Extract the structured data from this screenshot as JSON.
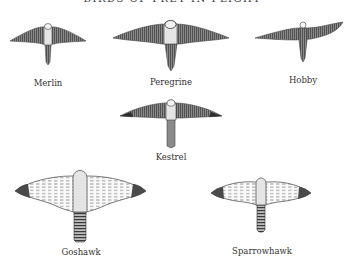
{
  "title": "BIRDS OF PREY IN FLIGHT",
  "colors": {
    "ink": "#555555",
    "dark_ink": "#3a3a3a",
    "background": "#ffffff"
  },
  "birds": [
    {
      "name": "Merlin",
      "group": "falcon",
      "label_x": 48,
      "label_y": 79
    },
    {
      "name": "Peregrine",
      "group": "falcon",
      "label_x": 171,
      "label_y": 78
    },
    {
      "name": "Hobby",
      "group": "falcon",
      "label_x": 303,
      "label_y": 76
    },
    {
      "name": "Kestrel",
      "group": "falcon",
      "label_x": 171,
      "label_y": 153
    },
    {
      "name": "Goshawk",
      "group": "hawk",
      "label_x": 81,
      "label_y": 248
    },
    {
      "name": "Sparrowhawk",
      "group": "hawk",
      "label_x": 262,
      "label_y": 247
    }
  ]
}
